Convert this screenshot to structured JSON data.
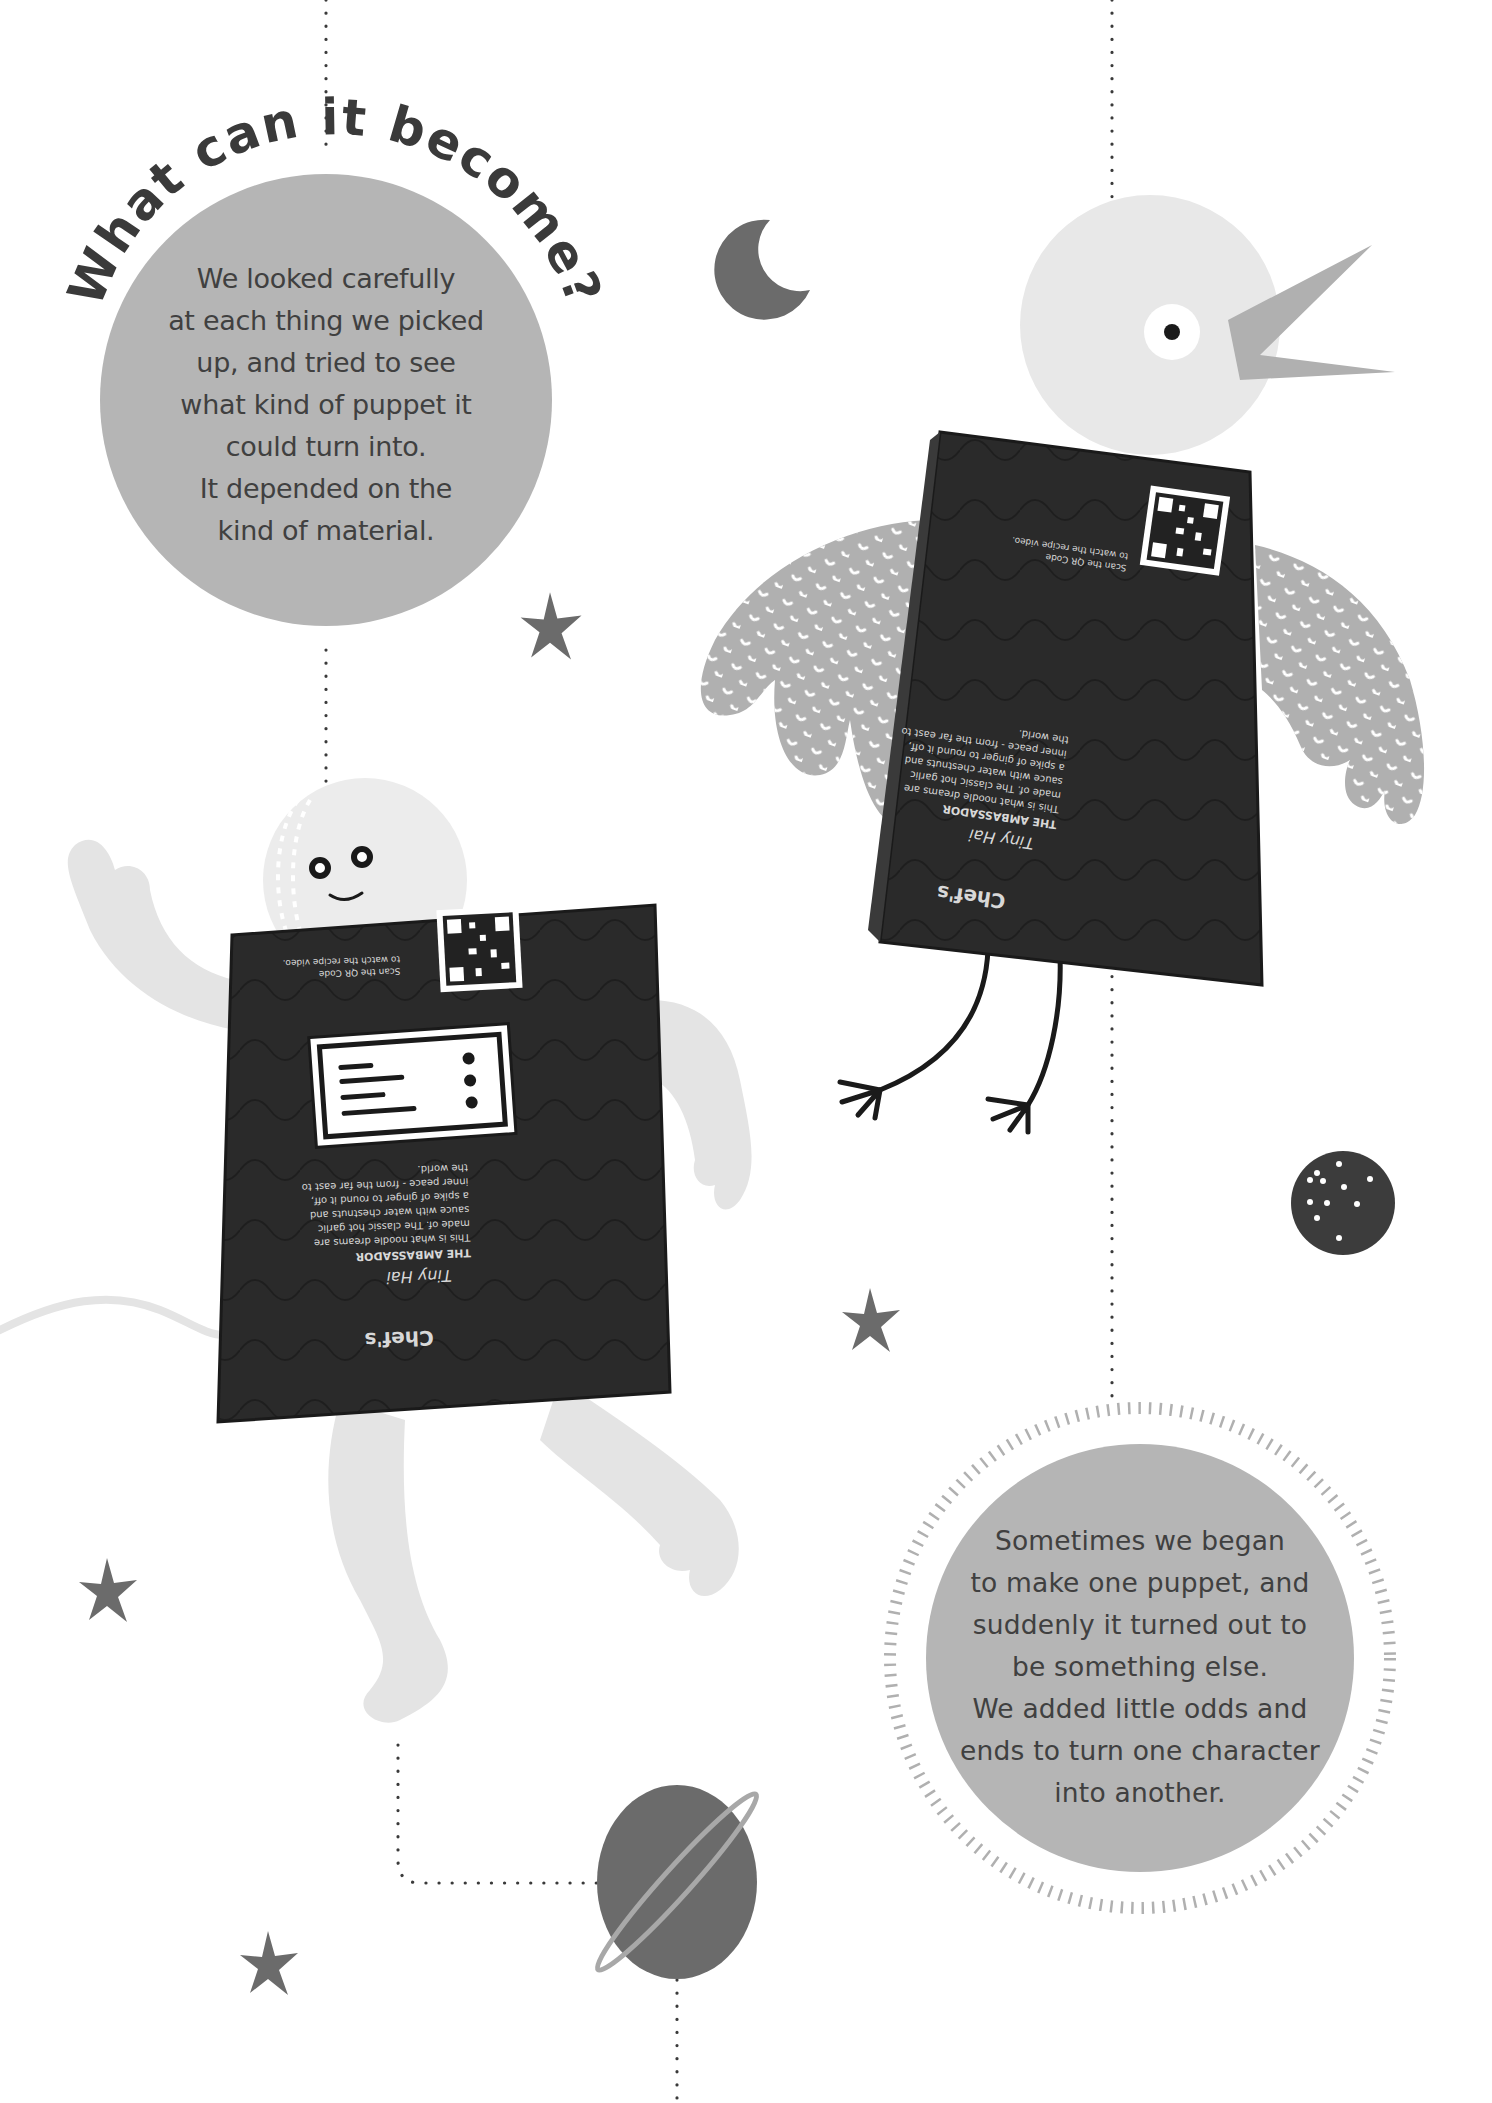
{
  "page": {
    "heading": "What can it become?",
    "intro_paragraph": {
      "lines": [
        "We looked carefully",
        "at each thing we picked",
        "up, and tried to see",
        "what kind of puppet it",
        "could turn into.",
        "It depended on the",
        "kind of material."
      ]
    },
    "outro_paragraph": {
      "lines": [
        "Sometimes we began",
        "to make one puppet, and",
        "suddenly it turned out to",
        "be something else.",
        "We added little odds and",
        "ends to turn one character",
        "into another."
      ]
    }
  },
  "illustrations": {
    "bird_puppet": {
      "package_brand": "Chef's",
      "package_product_script": "Tiny Hai",
      "package_title": "THE AMBASSADOR",
      "package_copy": [
        "This is what noodle dreams are",
        "made of. The classic hot garlic",
        "sauce with water chestnuts and",
        "a spike of ginger to round it off,",
        "inner peace - from the far east to",
        "the world."
      ],
      "qr_caption": [
        "Scan the QR Code",
        "to watch the recipe video."
      ],
      "social_handles": [
        "chefs",
        "chefs"
      ]
    },
    "astronaut_puppet": {
      "package_brand": "Chef's",
      "package_product_script": "Tiny Hai",
      "package_title": "THE AMBASSADOR",
      "package_copy": [
        "This is what noodle dreams are",
        "made of. The classic hot garlic",
        "sauce with water chestnuts and",
        "a spike of ginger to round it off,",
        "inner peace - from the far east to",
        "the world."
      ],
      "qr_caption": [
        "Scan the QR Code",
        "to watch the recipe video."
      ],
      "social_handles": [
        "chefs",
        "chefs"
      ]
    }
  },
  "colors": {
    "circle_fill": "#b5b5b5",
    "accent_dark": "#6b6b6b",
    "light_figure": "#e4e4e4",
    "wing_gray": "#b0b0b0",
    "package_dark": "#2a2a2a",
    "text": "#404040",
    "dotted_line": "#3a3a3a"
  }
}
